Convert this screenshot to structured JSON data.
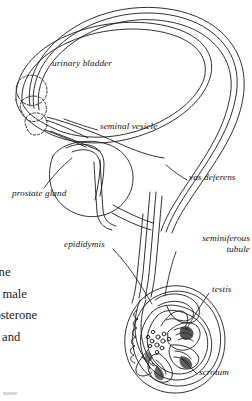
{
  "figure": {
    "style": "black and white line art",
    "line_color": "#1a1a1a",
    "background_color": "#ffffff"
  },
  "labels": [
    {
      "id": "urinary-bladder",
      "text": "urinary bladder",
      "x": 52,
      "y": 63,
      "leader": false
    },
    {
      "id": "seminal-vesicle",
      "text": "seminal vesicle",
      "x": 100,
      "y": 126,
      "leader": true
    },
    {
      "id": "prostate-gland",
      "text": "prostate gland",
      "x": 12,
      "y": 193,
      "leader": true
    },
    {
      "id": "vas-deferens",
      "text": "vas deferens",
      "x": 189,
      "y": 177,
      "leader": true
    },
    {
      "id": "epididymis",
      "text": "epididymis",
      "x": 64,
      "y": 244,
      "leader": true
    },
    {
      "id": "seminiferous-tubule",
      "line1": "seminiferous",
      "line2": "tubule",
      "x": 178,
      "y": 238,
      "leader": true
    },
    {
      "id": "testis",
      "text": "testis",
      "x": 212,
      "y": 289,
      "leader": true
    },
    {
      "id": "scrotum",
      "text": "scrotum",
      "x": 199,
      "y": 372,
      "leader": true
    }
  ],
  "body_text": {
    "note": "partially cropped paragraph text at left margin",
    "lines": [
      "none",
      "ult male",
      "stosterone",
      "m, and"
    ]
  }
}
